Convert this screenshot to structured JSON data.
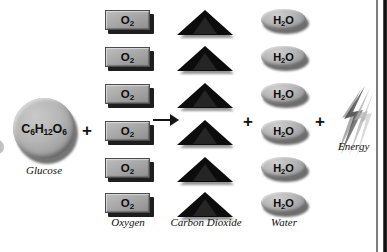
{
  "figure": {
    "type": "chemical-equation-diagram",
    "background_color": "#ffffff",
    "page_edge_color": "#0a0a0a"
  },
  "reactants": [
    {
      "id": "glucose",
      "formula_text": "C6H12O6",
      "formula_parts": [
        {
          "text": "C",
          "sub": false
        },
        {
          "text": "6",
          "sub": true
        },
        {
          "text": "H",
          "sub": false
        },
        {
          "text": "12",
          "sub": true
        },
        {
          "text": "O",
          "sub": false
        },
        {
          "text": "6",
          "sub": true
        }
      ],
      "caption": "Glucose",
      "icon": "gray-sphere",
      "count": 1,
      "color": "#b0b0b0"
    },
    {
      "id": "oxygen",
      "formula_text": "O2",
      "formula_parts": [
        {
          "text": "O",
          "sub": false
        },
        {
          "text": "2",
          "sub": true
        }
      ],
      "caption": "Oxygen",
      "icon": "gray-rectangle-block",
      "count": 6,
      "color": "#a9a9a9"
    }
  ],
  "products": [
    {
      "id": "carbon-dioxide",
      "formula_text": "",
      "caption": "Carbon Dioxide",
      "icon": "black-triangle",
      "count": 6,
      "color": "#0c0c0c"
    },
    {
      "id": "water",
      "formula_text": "H2O",
      "formula_parts": [
        {
          "text": "H",
          "sub": false
        },
        {
          "text": "2",
          "sub": true
        },
        {
          "text": "O",
          "sub": false
        }
      ],
      "caption": "Water",
      "icon": "gray-oval",
      "count": 6,
      "color": "#adadad"
    },
    {
      "id": "energy",
      "formula_text": "",
      "caption": "Energy",
      "icon": "lightning-bolt",
      "count": 1,
      "color": "#555555"
    }
  ],
  "operators": {
    "plus": "+",
    "arrow": "→",
    "plus_positions": [
      "between-glucose-and-oxygen",
      "between-co2-and-water",
      "between-water-and-energy"
    ],
    "arrow_position": "between-oxygen-and-co2"
  },
  "captions": {
    "glucose": "Glucose",
    "oxygen": "Oxygen",
    "carbon_dioxide": "Carbon Dioxide",
    "water": "Water",
    "energy": "Energy"
  },
  "labels": {
    "o2": "O",
    "o2_sub": "2",
    "h2o_h": "H",
    "h2o_sub": "2",
    "h2o_o": "O"
  }
}
